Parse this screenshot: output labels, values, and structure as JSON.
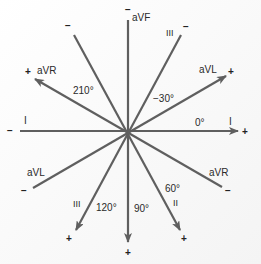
{
  "center": [
    128,
    131
  ],
  "colors": {
    "axis": "#5f5f5f",
    "text": "#2a2a2a",
    "background": "#ffffff"
  },
  "leads": [
    {
      "name": "I",
      "angle": 0,
      "angle_label": "0°",
      "positive_end": [
        238,
        131
      ],
      "negative_end": [
        20,
        131
      ]
    },
    {
      "name": "aVF",
      "angle": 90,
      "angle_label": "90°",
      "positive_end": [
        128,
        242
      ],
      "negative_end": [
        128,
        20
      ]
    },
    {
      "name": "aVL",
      "angle": -30,
      "angle_label": "−30°",
      "positive_end": [
        226,
        76
      ],
      "negative_end": [
        33,
        188
      ]
    },
    {
      "name": "aVR",
      "angle": 210,
      "angle_label": "210°",
      "positive_end": [
        35,
        79
      ],
      "negative_end": [
        222,
        187
      ]
    },
    {
      "name": "II",
      "angle": 60,
      "angle_label": "60°",
      "positive_end": [
        180,
        230
      ],
      "negative_end": [
        74,
        35
      ]
    },
    {
      "name": "III",
      "angle": 120,
      "angle_label": "120°",
      "positive_end": [
        76,
        230
      ],
      "negative_end": [
        181,
        35
      ]
    }
  ],
  "labels": {
    "aVF_top": "aVF",
    "III_top": "III",
    "aVL_right": "aVL",
    "aVR_left": "aVR",
    "angle_210": "210°",
    "angle_m30": "−30°",
    "I_left": "I",
    "I_right": "I",
    "angle_0": "0°",
    "aVL_left": "aVL",
    "aVR_right": "aVR",
    "III_bottom": "III",
    "angle_120": "120°",
    "angle_90": "90°",
    "angle_60": "60°",
    "II_bottom": "II"
  },
  "signs": {
    "plus": "+",
    "minus": "−"
  }
}
